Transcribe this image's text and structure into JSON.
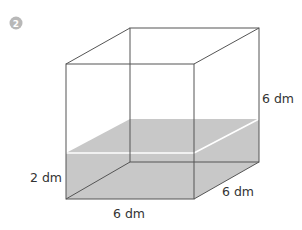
{
  "problem": {
    "number": "2",
    "badge_color": "#b8b8b8"
  },
  "figure": {
    "type": "rectangular prism (cube) partially filled with water",
    "water_color": "#c8c8c8",
    "edge_color": "#555555",
    "labels": {
      "height": "6 dm",
      "water_height": "2 dm",
      "width": "6 dm",
      "depth": "6 dm"
    }
  }
}
